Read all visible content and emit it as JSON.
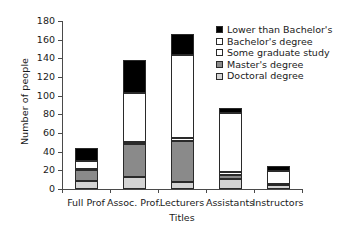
{
  "chart_data": {
    "type": "bar",
    "stacked": true,
    "title": "",
    "xlabel": "Titles",
    "ylabel": "Number of people",
    "ylim": [
      0,
      180
    ],
    "ytick_step": 20,
    "yticks": [
      0,
      20,
      40,
      60,
      80,
      100,
      120,
      140,
      160,
      180
    ],
    "grid": false,
    "legend_position": "top-right",
    "categories": [
      "Full Prof",
      "Assoc. Prof.",
      "Lecturers",
      "Assistants",
      "Instructors"
    ],
    "series": [
      {
        "name": "Doctoral degree",
        "color": "#d4d4d4",
        "values": [
          9,
          13,
          7,
          11,
          4
        ]
      },
      {
        "name": "Master's degree",
        "color": "#8a8a8a",
        "values": [
          11,
          35,
          44,
          4,
          1
        ]
      },
      {
        "name": "Some graduate study",
        "color": "#ffffff",
        "values": [
          1,
          2,
          4,
          3,
          0
        ]
      },
      {
        "name": "Bachelor's degree",
        "color": "#ffffff",
        "values": [
          9,
          53,
          89,
          63,
          14
        ]
      },
      {
        "name": "Lower than Bachelor's",
        "color": "#000000",
        "values": [
          14,
          35,
          22,
          6,
          6
        ]
      }
    ],
    "stack_order_bottom_to_top": [
      "Doctoral degree",
      "Master's degree",
      "Some graduate study",
      "Bachelor's degree",
      "Lower than Bachelor's"
    ],
    "totals": [
      44,
      138,
      166,
      87,
      25
    ],
    "legend_entries": [
      {
        "label": "Lower than Bachelor's",
        "color": "#000000"
      },
      {
        "label": "Bachelor's degree",
        "color": "#ffffff"
      },
      {
        "label": "Some graduate study",
        "color": "#ffffff"
      },
      {
        "label": "Master's degree",
        "color": "#8a8a8a"
      },
      {
        "label": "Doctoral degree",
        "color": "#d4d4d4"
      }
    ]
  }
}
